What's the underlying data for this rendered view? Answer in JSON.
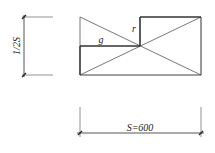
{
  "diagram": {
    "labels": {
      "height_dim": "1/2S",
      "width_dim": "S=600",
      "g": "g",
      "r": "r"
    },
    "colors": {
      "line": "#333333",
      "thin_line": "#555555",
      "dim_line": "#444444",
      "background": "#ffffff"
    },
    "rectangle": {
      "x": 80,
      "y": 17,
      "width": 121,
      "height": 58
    },
    "center": {
      "x": 140,
      "y": 46
    }
  }
}
